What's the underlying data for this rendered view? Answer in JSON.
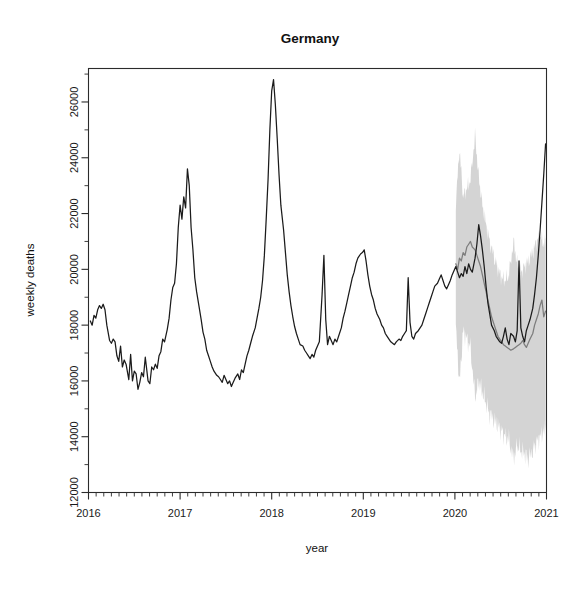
{
  "chart_data": {
    "type": "line",
    "title": "Germany",
    "xlabel": "year",
    "ylabel": "weekly deaths",
    "xlim": [
      2016.0,
      2021.0
    ],
    "ylim": [
      12000,
      27200
    ],
    "grid": false,
    "legend": null,
    "x_ticks_major": [
      "2016",
      "2017",
      "2018",
      "2019",
      "2020",
      "2021"
    ],
    "x_ticks_major_values": [
      2016,
      2017,
      2018,
      2019,
      2020,
      2021
    ],
    "x_minor_tick_interval_years": 0.0833,
    "y_ticks_major": [
      "12000",
      "14000",
      "16000",
      "18000",
      "20000",
      "22000",
      "24000",
      "26000"
    ],
    "y_ticks_major_values": [
      12000,
      14000,
      16000,
      18000,
      20000,
      22000,
      24000,
      26000
    ],
    "y_minor_tick_interval": 1000,
    "colors": {
      "observed_line": "#1b1b1b",
      "fitted_line": "#7d7d7d",
      "confidence_band": "#d2d2d2",
      "axis": "#2b2b2b",
      "text": "#111111",
      "background": "#ffffff"
    },
    "annotations": [
      "Shaded grey region from 2020.0 onward is the prediction interval",
      "Grey line is the expected/baseline weekly deaths",
      "Black line is the observed weekly deaths"
    ],
    "series": [
      {
        "name": "observed weekly deaths",
        "style": "solid-black",
        "x": [
          2016.02,
          2016.04,
          2016.06,
          2016.08,
          2016.1,
          2016.12,
          2016.14,
          2016.16,
          2016.18,
          2016.2,
          2016.23,
          2016.25,
          2016.27,
          2016.29,
          2016.31,
          2016.33,
          2016.35,
          2016.37,
          2016.39,
          2016.41,
          2016.44,
          2016.46,
          2016.48,
          2016.5,
          2016.52,
          2016.54,
          2016.56,
          2016.58,
          2016.6,
          2016.62,
          2016.65,
          2016.67,
          2016.69,
          2016.71,
          2016.73,
          2016.75,
          2016.77,
          2016.79,
          2016.81,
          2016.83,
          2016.86,
          2016.88,
          2016.9,
          2016.92,
          2016.94,
          2016.96,
          2016.98,
          2017.0,
          2017.02,
          2017.04,
          2017.06,
          2017.08,
          2017.1,
          2017.12,
          2017.14,
          2017.16,
          2017.18,
          2017.21,
          2017.23,
          2017.25,
          2017.27,
          2017.29,
          2017.31,
          2017.33,
          2017.35,
          2017.37,
          2017.4,
          2017.42,
          2017.44,
          2017.46,
          2017.48,
          2017.5,
          2017.52,
          2017.54,
          2017.56,
          2017.58,
          2017.6,
          2017.63,
          2017.65,
          2017.67,
          2017.69,
          2017.71,
          2017.73,
          2017.75,
          2017.77,
          2017.79,
          2017.82,
          2017.84,
          2017.86,
          2017.88,
          2017.9,
          2017.92,
          2017.94,
          2017.96,
          2017.98,
          2018.0,
          2018.02,
          2018.04,
          2018.06,
          2018.08,
          2018.1,
          2018.13,
          2018.15,
          2018.17,
          2018.19,
          2018.21,
          2018.23,
          2018.25,
          2018.27,
          2018.29,
          2018.31,
          2018.34,
          2018.36,
          2018.38,
          2018.4,
          2018.42,
          2018.44,
          2018.46,
          2018.48,
          2018.5,
          2018.52,
          2018.55,
          2018.57,
          2018.59,
          2018.61,
          2018.63,
          2018.65,
          2018.67,
          2018.69,
          2018.71,
          2018.73,
          2018.76,
          2018.78,
          2018.8,
          2018.82,
          2018.84,
          2018.86,
          2018.88,
          2018.9,
          2018.92,
          2018.94,
          2018.97,
          2018.99,
          2019.01,
          2019.03,
          2019.05,
          2019.07,
          2019.09,
          2019.11,
          2019.13,
          2019.15,
          2019.18,
          2019.2,
          2019.22,
          2019.24,
          2019.26,
          2019.28,
          2019.3,
          2019.32,
          2019.34,
          2019.36,
          2019.39,
          2019.41,
          2019.43,
          2019.45,
          2019.47,
          2019.49,
          2019.51,
          2019.53,
          2019.55,
          2019.57,
          2019.6,
          2019.62,
          2019.64,
          2019.66,
          2019.68,
          2019.7,
          2019.72,
          2019.74,
          2019.76,
          2019.78,
          2019.81,
          2019.83,
          2019.85,
          2019.87,
          2019.89,
          2019.91,
          2019.93,
          2019.95,
          2019.97,
          2019.99,
          2020.01,
          2020.03,
          2020.05,
          2020.07,
          2020.09,
          2020.11,
          2020.13,
          2020.15,
          2020.17,
          2020.19,
          2020.22,
          2020.24,
          2020.26,
          2020.28,
          2020.3,
          2020.32,
          2020.34,
          2020.36,
          2020.38,
          2020.4,
          2020.43,
          2020.45,
          2020.47,
          2020.49,
          2020.51,
          2020.53,
          2020.55,
          2020.57,
          2020.59,
          2020.61,
          2020.64,
          2020.66,
          2020.68,
          2020.7,
          2020.72,
          2020.74,
          2020.76,
          2020.78,
          2020.8,
          2020.82,
          2020.85,
          2020.87,
          2020.89,
          2020.91,
          2020.93,
          2020.95,
          2020.97,
          2020.99
        ],
        "y": [
          18150,
          18000,
          18350,
          18250,
          18550,
          18700,
          18600,
          18750,
          18550,
          18000,
          17450,
          17350,
          17500,
          17400,
          16900,
          16700,
          17250,
          16500,
          16750,
          16600,
          16050,
          16950,
          16000,
          16350,
          16250,
          15700,
          15950,
          16300,
          16150,
          16850,
          16000,
          15900,
          16500,
          16400,
          16600,
          16450,
          16900,
          17050,
          17500,
          17400,
          17850,
          18250,
          18900,
          19350,
          19500,
          20200,
          21500,
          22300,
          21800,
          22600,
          22200,
          23600,
          23000,
          21500,
          20700,
          19700,
          19200,
          18600,
          18200,
          17750,
          17500,
          17100,
          16900,
          16700,
          16500,
          16350,
          16200,
          16150,
          16050,
          15950,
          16200,
          16050,
          15900,
          16000,
          15800,
          15950,
          16100,
          16250,
          16050,
          16400,
          16300,
          16600,
          16900,
          17100,
          17350,
          17600,
          17900,
          18250,
          18600,
          19000,
          19600,
          20500,
          21800,
          23200,
          25000,
          26400,
          26800,
          25900,
          24700,
          23400,
          22300,
          21400,
          20600,
          19800,
          19200,
          18700,
          18300,
          17950,
          17700,
          17500,
          17300,
          17250,
          17100,
          17000,
          16900,
          16800,
          16950,
          16850,
          17100,
          17250,
          17400,
          19100,
          20500,
          18200,
          17300,
          17600,
          17450,
          17300,
          17500,
          17400,
          17600,
          17900,
          18250,
          18500,
          18800,
          19100,
          19400,
          19700,
          19900,
          20200,
          20400,
          20550,
          20600,
          20700,
          20300,
          19800,
          19400,
          19100,
          18900,
          18600,
          18400,
          18200,
          18000,
          17900,
          17700,
          17600,
          17500,
          17400,
          17350,
          17300,
          17400,
          17500,
          17450,
          17600,
          17700,
          17800,
          19700,
          18100,
          17600,
          17500,
          17700,
          17800,
          17900,
          18000,
          18200,
          18400,
          18600,
          18800,
          19000,
          19200,
          19400,
          19500,
          19650,
          19800,
          19600,
          19400,
          19300,
          19450,
          19600,
          19800,
          19950,
          20100,
          19900,
          19700,
          19850,
          19750,
          20100,
          19850,
          20200,
          20000,
          19900,
          20400,
          20900,
          21600,
          21200,
          20700,
          20100,
          19400,
          18800,
          18400,
          18000,
          17800,
          17600,
          17500,
          17400,
          17350,
          17600,
          17900,
          17500,
          17300,
          17700,
          17600,
          17400,
          17800,
          20300,
          17900,
          17600,
          17400,
          17800,
          18000,
          18200,
          18600,
          19100,
          19700,
          20500,
          21400,
          22400,
          23400,
          24500
        ]
      },
      {
        "name": "expected weekly deaths (baseline model)",
        "style": "solid-grey",
        "x": [
          2020.01,
          2020.03,
          2020.05,
          2020.07,
          2020.09,
          2020.11,
          2020.13,
          2020.15,
          2020.17,
          2020.19,
          2020.22,
          2020.24,
          2020.26,
          2020.28,
          2020.3,
          2020.32,
          2020.34,
          2020.36,
          2020.38,
          2020.4,
          2020.43,
          2020.45,
          2020.47,
          2020.49,
          2020.51,
          2020.53,
          2020.55,
          2020.57,
          2020.59,
          2020.61,
          2020.64,
          2020.66,
          2020.68,
          2020.7,
          2020.72,
          2020.74,
          2020.76,
          2020.78,
          2020.8,
          2020.82,
          2020.85,
          2020.87,
          2020.89,
          2020.91,
          2020.93,
          2020.95,
          2020.97,
          2020.99
        ],
        "y": [
          20200,
          20000,
          20400,
          20300,
          20600,
          20500,
          20800,
          20900,
          21000,
          20800,
          20700,
          20500,
          20300,
          20100,
          19800,
          19500,
          19200,
          18900,
          18600,
          18300,
          18000,
          17800,
          17600,
          17500,
          17400,
          17300,
          17250,
          17200,
          17150,
          17100,
          17150,
          17200,
          17250,
          17300,
          17350,
          17450,
          17300,
          17200,
          17350,
          17500,
          17700,
          18000,
          18200,
          18400,
          18700,
          18900,
          18300,
          18500
        ]
      }
    ],
    "confidence_band": {
      "name": "prediction interval",
      "x": [
        2020.01,
        2020.05,
        2020.09,
        2020.13,
        2020.17,
        2020.22,
        2020.26,
        2020.3,
        2020.34,
        2020.38,
        2020.43,
        2020.47,
        2020.51,
        2020.55,
        2020.59,
        2020.64,
        2020.68,
        2020.72,
        2020.76,
        2020.8,
        2020.85,
        2020.89,
        2020.93,
        2020.97,
        2020.99
      ],
      "upper": [
        22400,
        24300,
        22600,
        22900,
        23200,
        24800,
        23300,
        22300,
        21600,
        21000,
        20400,
        20000,
        19700,
        19600,
        19800,
        21000,
        20200,
        19900,
        20100,
        20300,
        20600,
        21000,
        21200,
        20900,
        21100
      ],
      "lower": [
        17900,
        15900,
        17800,
        17500,
        17200,
        15400,
        16000,
        15600,
        15200,
        14800,
        14600,
        14400,
        14200,
        14000,
        13900,
        13200,
        13700,
        13500,
        13400,
        13200,
        13500,
        13800,
        14000,
        14200,
        14400
      ]
    }
  }
}
